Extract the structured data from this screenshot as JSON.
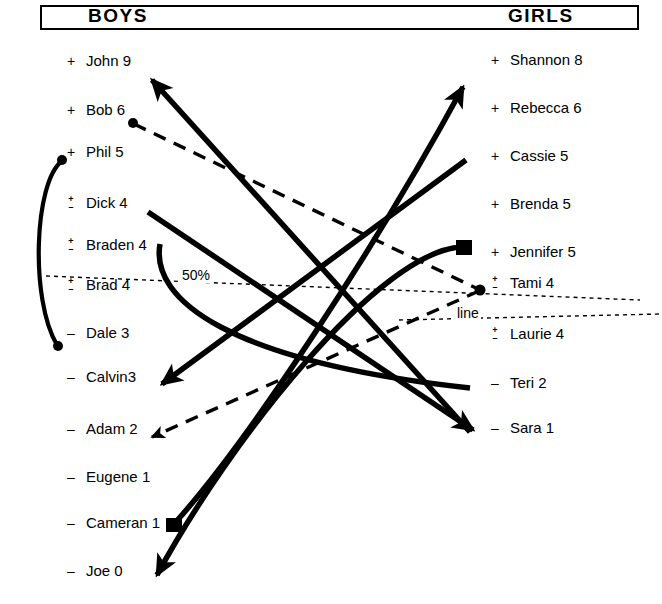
{
  "header": {
    "left_title": "BOYS",
    "right_title": "GIRLS"
  },
  "annotations": {
    "percent_label": "50%",
    "line_label": "line"
  },
  "boys": [
    {
      "sign": "+",
      "name": "John 9"
    },
    {
      "sign": "+",
      "name": "Bob 6"
    },
    {
      "sign": "+",
      "name": "Phil 5"
    },
    {
      "sign": "+/-",
      "name": "Dick 4"
    },
    {
      "sign": "+/-",
      "name": "Braden 4"
    },
    {
      "sign": "+/-",
      "name": "Brad 4"
    },
    {
      "sign": "-",
      "name": "Dale 3"
    },
    {
      "sign": "-",
      "name": "Calvin3"
    },
    {
      "sign": "-",
      "name": "Adam 2"
    },
    {
      "sign": "-",
      "name": "Eugene 1"
    },
    {
      "sign": "-",
      "name": "Cameran 1"
    },
    {
      "sign": "-",
      "name": "Joe 0"
    }
  ],
  "girls": [
    {
      "sign": "+",
      "name": "Shannon 8"
    },
    {
      "sign": "+",
      "name": "Rebecca 6"
    },
    {
      "sign": "+",
      "name": "Cassie 5"
    },
    {
      "sign": "+",
      "name": "Brenda 5"
    },
    {
      "sign": "+",
      "name": "Jennifer 5"
    },
    {
      "sign": "+/-",
      "name": "Tami 4"
    },
    {
      "sign": "+/-",
      "name": "Laurie 4"
    },
    {
      "sign": "-",
      "name": "Teri 2"
    },
    {
      "sign": "-",
      "name": "Sara 1"
    }
  ],
  "colors": {
    "ink": "#000000",
    "paper": "#ffffff"
  }
}
